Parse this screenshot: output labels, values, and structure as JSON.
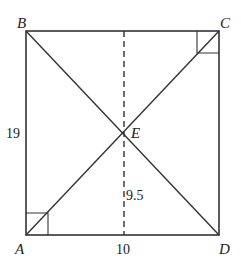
{
  "diagram": {
    "type": "geometry",
    "shape": "rectangle ABCD with diagonals AC and BD intersecting at E",
    "vertices": {
      "A": "A",
      "B": "B",
      "C": "C",
      "D": "D",
      "E": "E"
    },
    "measurements": {
      "side_AB": "19",
      "height_E": "9.5",
      "side_AD": "10"
    },
    "right_angle_marks": [
      "A",
      "C"
    ],
    "dashed_line": "vertical altitude from E through midpoint of AD and BC"
  }
}
